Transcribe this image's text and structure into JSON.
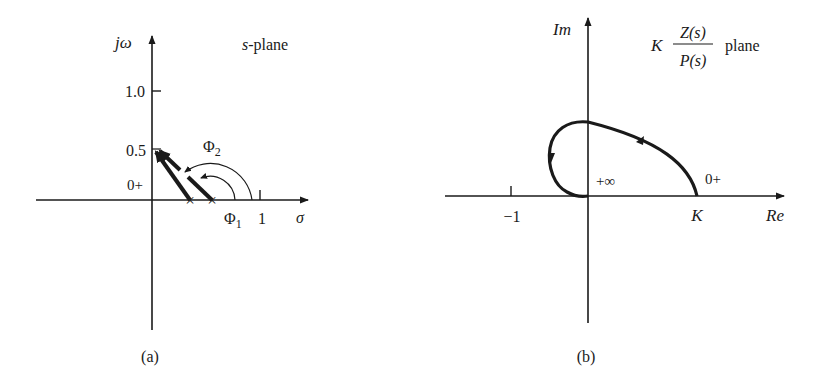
{
  "figure_a": {
    "caption": "(a)",
    "plane_label": "s-plane",
    "plane_label_prefix": "s",
    "plane_label_suffix": "-plane",
    "vertical_axis_label": "jω",
    "horizontal_axis_label": "σ",
    "y_ticks": [
      {
        "label": "1.0",
        "value": 1.0
      },
      {
        "label": "0.5",
        "value": 0.5
      },
      {
        "label": "0+",
        "value": 0
      }
    ],
    "x_ticks": [
      {
        "label": "1",
        "value": 1
      }
    ],
    "poles": [
      {
        "marker": "×",
        "sigma": 0.37
      },
      {
        "marker": "×",
        "sigma": 0.58
      }
    ],
    "angles": [
      {
        "label": "Φ",
        "subscript": "1"
      },
      {
        "label": "Φ",
        "subscript": "2"
      }
    ]
  },
  "figure_b": {
    "caption": "(b)",
    "plane_label_gain": "K",
    "plane_label_numerator": "Z(s)",
    "plane_label_denominator": "P(s)",
    "plane_label_suffix": "plane",
    "vertical_axis_label": "Im",
    "horizontal_axis_label": "Re",
    "x_ticks": [
      {
        "label": "−1",
        "value": -1
      },
      {
        "label": "K",
        "value": "K"
      }
    ],
    "curve_labels": {
      "start": "0+",
      "end": "+∞"
    }
  },
  "colors": {
    "ink": "#1a1a1a",
    "background": "#ffffff"
  }
}
